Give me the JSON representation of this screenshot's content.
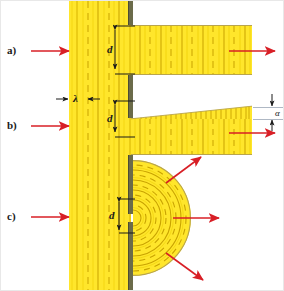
{
  "figure": {
    "background_color": "#ffffff",
    "wave_color": "#ffe62b",
    "wave_line_color": "#c9a300",
    "barrier_color": "#6b6b4a",
    "arrow_color": "#d81f26",
    "dim_arrow_color": "#1a1a1a",
    "width": 284,
    "height": 291
  },
  "panels": [
    {
      "id": "a",
      "label": "a)",
      "label_x": 6,
      "label_y": 44,
      "slit_label": "d",
      "description": "wide slit, beam passes nearly undiffracted",
      "incoming_arrow": {
        "x1": 30,
        "y1": 50,
        "x2": 62,
        "y2": 50
      },
      "outgoing_arrow": {
        "x1": 228,
        "y1": 50,
        "x2": 272,
        "y2": 50
      }
    },
    {
      "id": "b",
      "label": "b)",
      "label_x": 6,
      "label_y": 119,
      "slit_label": "d",
      "angle_label": "α",
      "description": "narrower slit, beam spreads by angle alpha",
      "incoming_arrow": {
        "x1": 30,
        "y1": 125,
        "x2": 62,
        "y2": 125
      },
      "outgoing_arrow": {
        "x1": 228,
        "y1": 132,
        "x2": 272,
        "y2": 132
      }
    },
    {
      "id": "c",
      "label": "c)",
      "label_x": 6,
      "label_y": 210,
      "slit_label": "d",
      "description": "slit comparable to wavelength, circular wavefronts radiate",
      "incoming_arrow": {
        "x1": 30,
        "y1": 216,
        "x2": 62,
        "y2": 216
      },
      "radial_arrows": [
        {
          "angle_deg": -45
        },
        {
          "angle_deg": 0
        },
        {
          "angle_deg": 45
        }
      ]
    }
  ],
  "annotations": {
    "wavelength_label": "λ",
    "wavelength_label_x": 73,
    "wavelength_label_y": 92,
    "wavelength_left_arrow": {
      "x1": 55,
      "y1": 98,
      "x2": 66,
      "y2": 98
    },
    "wavelength_right_arrow": {
      "x1": 98,
      "y1": 98,
      "x2": 87,
      "y2": 98
    },
    "slit_d_labels": [
      {
        "text": "d",
        "x": 108,
        "y": 44
      },
      {
        "text": "d",
        "x": 108,
        "y": 118
      },
      {
        "text": "d",
        "x": 108,
        "y": 207
      }
    ],
    "alpha_label": {
      "text": "α",
      "x": 268,
      "y": 112
    }
  }
}
